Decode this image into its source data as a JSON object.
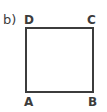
{
  "figure": {
    "part_label": "b)",
    "shape_name": "square",
    "stroke_color": "#3c3c3c",
    "fill_color": "#ffffff",
    "background_color": "#ffffff",
    "stroke_width": 2,
    "vertices": [
      {
        "id": "A",
        "label": "A",
        "position": "bottom-left"
      },
      {
        "id": "B",
        "label": "B",
        "position": "bottom-right"
      },
      {
        "id": "C",
        "label": "C",
        "position": "top-right"
      },
      {
        "id": "D",
        "label": "D",
        "position": "top-left"
      }
    ]
  }
}
